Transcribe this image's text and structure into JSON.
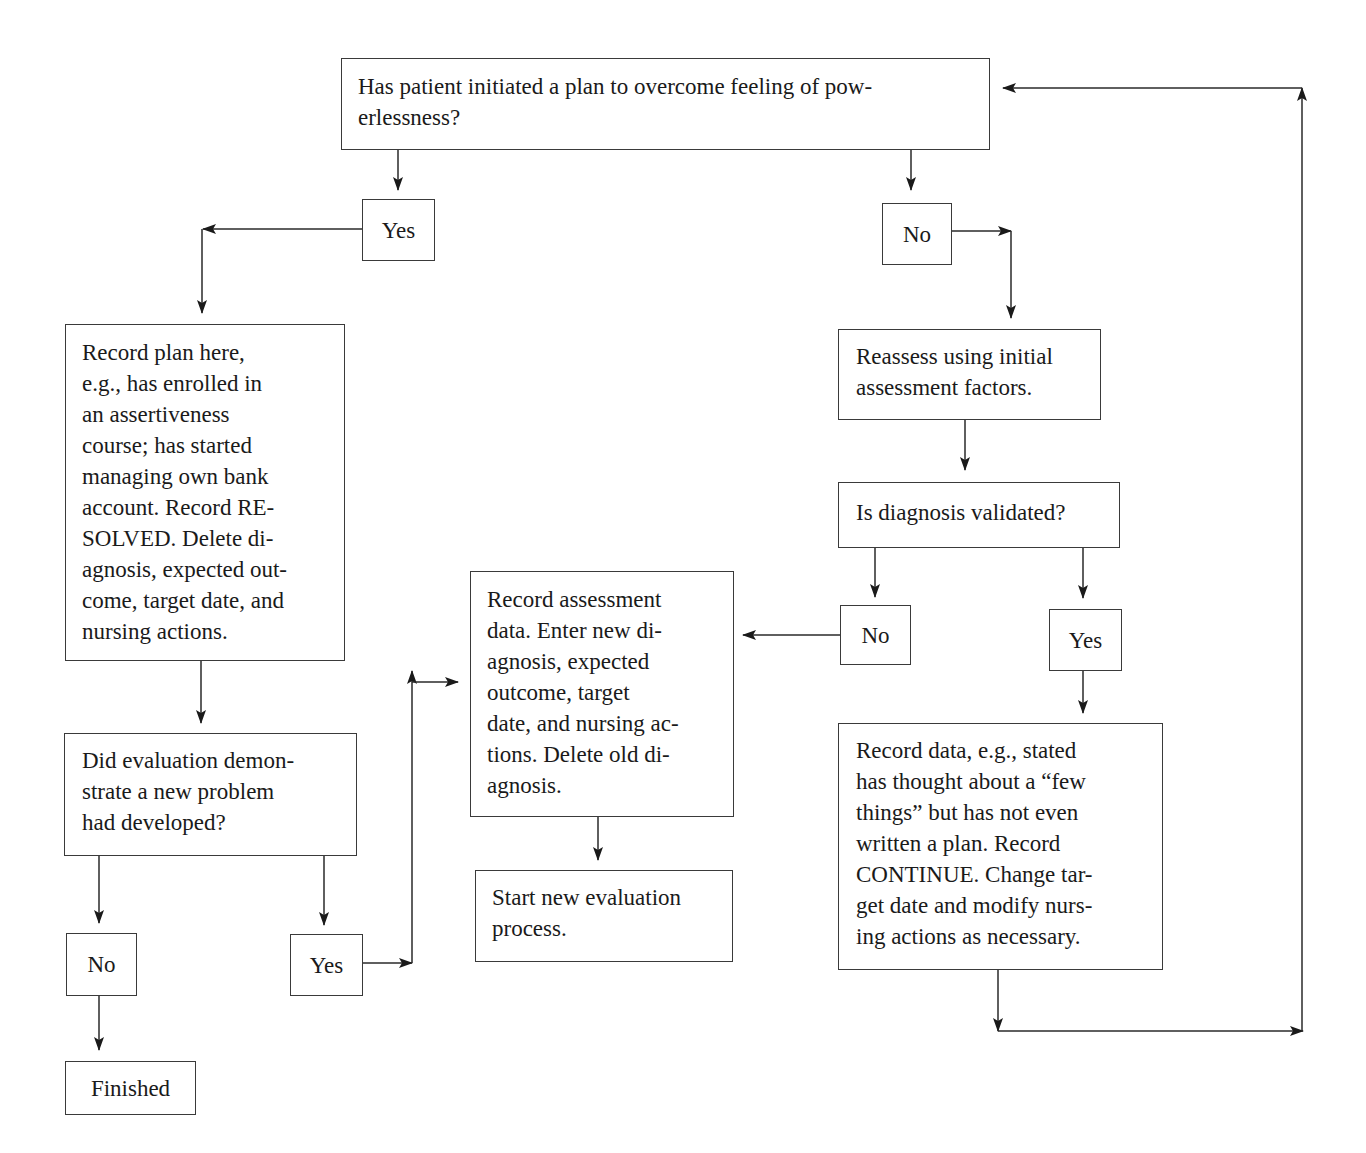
{
  "diagram": {
    "type": "flowchart",
    "nodes": {
      "q_plan": {
        "text": "Has patient initiated a plan to overcome feeling of pow-\nerlessness?"
      },
      "q_plan_yes": {
        "text": "Yes"
      },
      "q_plan_no": {
        "text": "No"
      },
      "record_plan": {
        "text": "Record plan here,\ne.g., has enrolled in\nan assertiveness\ncourse; has started\nmanaging own bank\naccount. Record RE-\nSOLVED. Delete di-\nagnosis, expected out-\ncome, target date, and\nnursing actions."
      },
      "reassess": {
        "text": "Reassess using initial\nassessment factors."
      },
      "q_validated": {
        "text": "Is diagnosis validated?"
      },
      "q_validated_no": {
        "text": "No"
      },
      "q_validated_yes": {
        "text": "Yes"
      },
      "record_assessment": {
        "text": "Record assessment\ndata. Enter new di-\nagnosis, expected\noutcome, target\ndate, and nursing ac-\ntions. Delete old di-\nagnosis."
      },
      "start_new_eval": {
        "text": "Start new evaluation\nprocess."
      },
      "record_data_continue": {
        "text": "Record data, e.g., stated\nhas thought about a “few\nthings” but has not even\nwritten a plan. Record\nCONTINUE. Change tar-\nget date and modify nurs-\ning actions as necessary."
      },
      "q_new_problem": {
        "text": "Did evaluation demon-\nstrate a new problem\nhad developed?"
      },
      "q_new_problem_no": {
        "text": "No"
      },
      "q_new_problem_yes": {
        "text": "Yes"
      },
      "finished": {
        "text": "Finished"
      }
    },
    "edges": [
      [
        "q_plan",
        "q_plan_yes"
      ],
      [
        "q_plan",
        "q_plan_no"
      ],
      [
        "q_plan_yes",
        "record_plan"
      ],
      [
        "q_plan_no",
        "reassess"
      ],
      [
        "reassess",
        "q_validated"
      ],
      [
        "q_validated",
        "q_validated_no"
      ],
      [
        "q_validated",
        "q_validated_yes"
      ],
      [
        "q_validated_no",
        "record_assessment"
      ],
      [
        "q_validated_yes",
        "record_data_continue"
      ],
      [
        "record_data_continue",
        "q_plan"
      ],
      [
        "record_assessment",
        "start_new_eval"
      ],
      [
        "record_plan",
        "q_new_problem"
      ],
      [
        "q_new_problem",
        "q_new_problem_no"
      ],
      [
        "q_new_problem",
        "q_new_problem_yes"
      ],
      [
        "q_new_problem_no",
        "finished"
      ],
      [
        "q_new_problem_yes",
        "record_assessment"
      ]
    ],
    "colors": {
      "line": "#2a2a2a",
      "text": "#1a1a1a",
      "background": "#ffffff"
    }
  }
}
